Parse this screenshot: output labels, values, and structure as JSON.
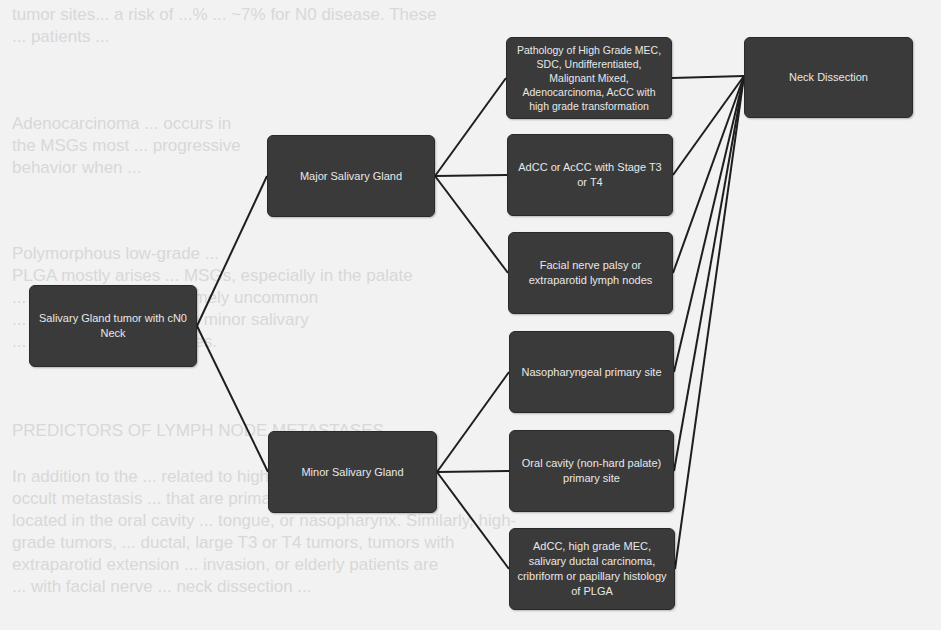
{
  "background_text": {
    "lines": [
      "tumor sites... a risk of ...% ... ~7% for N0 disease. These",
      "... patients ...",
      "Adenocarcinoma ... occurs in",
      "the MSGs most ... progressive",
      "behavior when ...",
      "Polymorphous low-grade ...",
      "PLGA mostly arises ... MSGs, especially in the palate",
      "... and cancer ... is extremely uncommon",
      "... In the case of ... of the minor salivary",
      "... is greater ... metastases.",
      "PREDICTORS OF LYMPH NODE METASTASES",
      "In addition to the ... related to higher risk of",
      "occult metastasis ... that are primarily",
      "located in the oral cavity ... tongue, or nasopharynx. Similarly, high-",
      "grade tumors, ... ductal, large T3 or T4 tumors, tumors with",
      "extraparotid extension ... invasion, or elderly patients are",
      "... with facial nerve ... neck dissection ..."
    ]
  },
  "diagram": {
    "root": {
      "label": "Salivary Gland tumor with cN0 Neck"
    },
    "branches": [
      {
        "label": "Major Salivary Gland"
      },
      {
        "label": "Minor Salivary Gland"
      }
    ],
    "criteria": [
      {
        "label": "Pathology of High Grade MEC, SDC, Undifferentiated, Malignant Mixed, Adenocarcinoma, AcCC with high grade transformation",
        "branch": "Major Salivary Gland"
      },
      {
        "label": "AdCC or AcCC with Stage T3 or T4",
        "branch": "Major Salivary Gland"
      },
      {
        "label": "Facial nerve palsy or extraparotid lymph nodes",
        "branch": "Major Salivary Gland"
      },
      {
        "label": "Nasopharyngeal primary site",
        "branch": "Minor Salivary Gland"
      },
      {
        "label": "Oral cavity (non-hard palate) primary site",
        "branch": "Minor Salivary Gland"
      },
      {
        "label": "AdCC, high grade MEC, salivary ductal carcinoma, cribriform or papillary histology of PLGA",
        "branch": "Minor Salivary Gland"
      }
    ],
    "outcome": {
      "label": "Neck Dissection"
    },
    "colors": {
      "node_fill": "#3a3a3a",
      "node_text": "#e8e8e8",
      "edge": "#1e1e1e",
      "background": "#f2f2f2"
    }
  }
}
